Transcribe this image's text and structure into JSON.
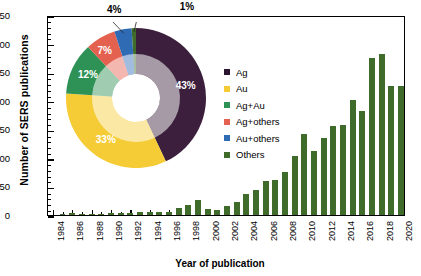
{
  "chart_data": {
    "type": "bar",
    "title": "",
    "xlabel": "Year of publication",
    "ylabel": "Number of SERS publications",
    "ylim": [
      0,
      350
    ],
    "ytick_values": [
      0,
      50,
      100,
      150,
      200,
      250,
      300,
      350
    ],
    "ytick_labels": [
      "0",
      "50",
      "100",
      "150",
      "200",
      "250",
      "300",
      "350"
    ],
    "xtick_labels": [
      "1984",
      "1986",
      "1988",
      "1990",
      "1992",
      "1994",
      "1996",
      "1998",
      "2000",
      "2002",
      "2004",
      "2006",
      "2008",
      "2010",
      "2012",
      "2014",
      "2016",
      "2018",
      "2020"
    ],
    "grid": false,
    "bar_color": "#3f6b2b",
    "categories": [
      1984,
      1985,
      1986,
      1987,
      1988,
      1989,
      1990,
      1991,
      1992,
      1993,
      1994,
      1995,
      1996,
      1997,
      1998,
      1999,
      2000,
      2001,
      2002,
      2003,
      2004,
      2005,
      2006,
      2007,
      2008,
      2009,
      2010,
      2011,
      2012,
      2013,
      2014,
      2015,
      2016,
      2017,
      2018,
      2019,
      2020
    ],
    "values": [
      0,
      1,
      4,
      1,
      2,
      1,
      3,
      4,
      4,
      6,
      5,
      5,
      6,
      13,
      17,
      26,
      11,
      9,
      15,
      22,
      37,
      43,
      59,
      62,
      75,
      103,
      141,
      112,
      134,
      156,
      157,
      202,
      182,
      274,
      282,
      226,
      226
    ],
    "series": [
      {
        "name": "Number of SERS publications",
        "values": [
          0,
          1,
          4,
          1,
          2,
          1,
          3,
          4,
          4,
          6,
          5,
          5,
          6,
          13,
          17,
          26,
          11,
          9,
          15,
          22,
          37,
          43,
          59,
          62,
          75,
          103,
          141,
          112,
          134,
          156,
          157,
          202,
          182,
          274,
          282,
          226,
          226
        ]
      }
    ],
    "inset": {
      "type": "pie",
      "donut": true,
      "start_angle_deg": 0,
      "direction": "clockwise",
      "labels": [
        "Ag",
        "Au",
        "Ag+Au",
        "Ag+others",
        "Au+others",
        "Others"
      ],
      "values": [
        43,
        33,
        12,
        7,
        4,
        1
      ],
      "value_labels": [
        "43%",
        "33%",
        "12%",
        "7%",
        "4%",
        "1%"
      ],
      "colors": [
        "#3b1f3c",
        "#f5cc36",
        "#2e9156",
        "#e4604f",
        "#2f6bb5",
        "#3f6b2b"
      ],
      "legend_position": "right"
    }
  },
  "legend": {
    "items": [
      {
        "label": "Ag",
        "color": "#2b1530"
      },
      {
        "label": "Au",
        "color": "#f5cc36"
      },
      {
        "label": "Ag+Au",
        "color": "#2e9156"
      },
      {
        "label": "Ag+others",
        "color": "#e4604f"
      },
      {
        "label": "Au+others",
        "color": "#2f6bb5"
      },
      {
        "label": "Others",
        "color": "#3f6b2b"
      }
    ]
  }
}
